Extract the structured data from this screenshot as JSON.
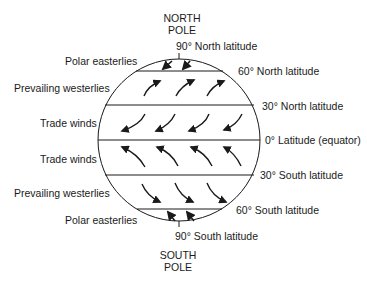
{
  "diagram": {
    "poles": {
      "north": {
        "line1": "NORTH",
        "line2": "POLE"
      },
      "south": {
        "line1": "SOUTH",
        "line2": "POLE"
      }
    },
    "latitudes": {
      "n90": "90° North latitude",
      "n60": "60° North latitude",
      "n30": "30° North latitude",
      "eq": "0° Latitude (equator)",
      "s30": "30° South latitude",
      "s60": "60° South latitude",
      "s90": "90° South latitude"
    },
    "belts": {
      "north_polar": "Polar easterlies",
      "north_westerlies": "Prevailing westerlies",
      "north_trade": "Trade winds",
      "south_trade": "Trade winds",
      "south_westerlies": "Prevailing westerlies",
      "south_polar": "Polar easterlies"
    },
    "colors": {
      "ink": "#1a1a1a",
      "background": "#ffffff"
    }
  }
}
